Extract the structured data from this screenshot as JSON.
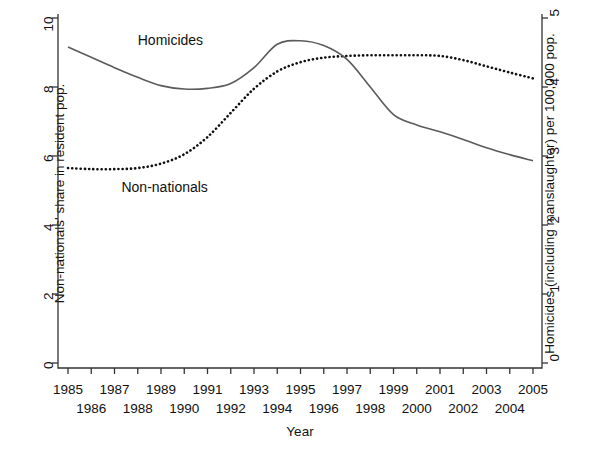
{
  "chart_data": {
    "type": "line",
    "title": "",
    "xlabel": "Year",
    "ylabel": "Non-nationals' share in resident pop.",
    "ylabel_right": "Homicides (including manslaughter) per 100,000 pop.",
    "x": [
      1985,
      1986,
      1987,
      1988,
      1989,
      1990,
      1991,
      1992,
      1993,
      1994,
      1995,
      1996,
      1997,
      1998,
      1999,
      2000,
      2001,
      2002,
      2003,
      2004,
      2005
    ],
    "xtick_labels_row1": [
      "1985",
      "1987",
      "1989",
      "1991",
      "1993",
      "1995",
      "1997",
      "1999",
      "2001",
      "2003",
      "2005"
    ],
    "xtick_labels_row2": [
      "1986",
      "1988",
      "1990",
      "1992",
      "1994",
      "1996",
      "1998",
      "2000",
      "2002",
      "2004"
    ],
    "xlim": [
      1985,
      2005
    ],
    "ylim": [
      0,
      10
    ],
    "ytick_labels": [
      "0",
      "2",
      "4",
      "6",
      "8",
      "10"
    ],
    "ytick_values": [
      0,
      2,
      4,
      6,
      8,
      10
    ],
    "ylim_right": [
      0,
      5
    ],
    "ytick_labels_right": [
      "0",
      "1",
      "2",
      "3",
      "4",
      "5"
    ],
    "ytick_values_right": [
      0,
      1,
      2,
      3,
      4,
      5
    ],
    "grid": false,
    "legend_position": "inline-annotations",
    "series": [
      {
        "name": "Non-nationals",
        "axis": "left",
        "style": "dotted",
        "color": "#101010",
        "label_annotation": "Non-nationals",
        "values": [
          5.65,
          5.62,
          5.62,
          5.65,
          5.78,
          6.05,
          6.55,
          7.25,
          7.95,
          8.45,
          8.72,
          8.85,
          8.9,
          8.92,
          8.92,
          8.92,
          8.9,
          8.78,
          8.6,
          8.42,
          8.25
        ]
      },
      {
        "name": "Homicides",
        "axis": "right",
        "style": "solid",
        "color": "#5b5b5b",
        "label_annotation": "Homicides",
        "values": [
          4.58,
          4.43,
          4.28,
          4.14,
          4.02,
          3.97,
          3.98,
          4.05,
          4.28,
          4.62,
          4.67,
          4.6,
          4.4,
          4.0,
          3.6,
          3.45,
          3.35,
          3.24,
          3.12,
          3.02,
          2.93
        ]
      }
    ],
    "annotations": [
      {
        "text": "Homicides",
        "x": 1988.0,
        "y": 9.3,
        "axis": "left"
      },
      {
        "text": "Non-nationals",
        "x": 1987.3,
        "y": 5.05,
        "axis": "left"
      }
    ]
  }
}
